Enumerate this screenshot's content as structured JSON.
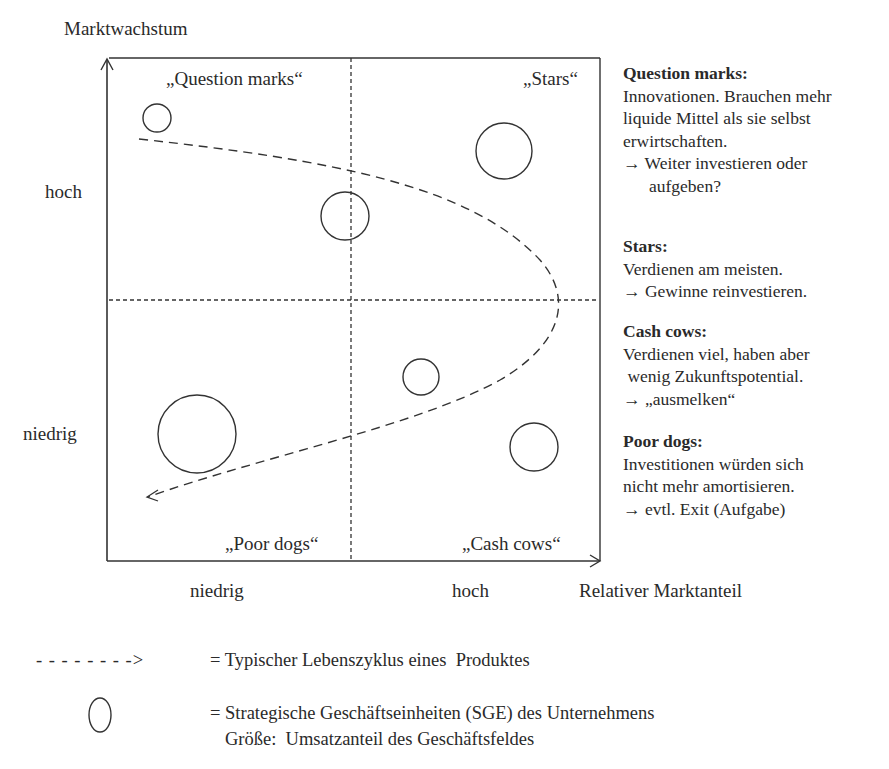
{
  "diagram": {
    "y_axis_title": "Marktwachstum",
    "x_axis_title": "Relativer Marktanteil",
    "y_ticks": [
      "hoch",
      "niedrig"
    ],
    "x_ticks": [
      "niedrig",
      "hoch"
    ],
    "quadrants": {
      "top_left": "„Question marks“",
      "top_right": "„Stars“",
      "bottom_left": "„Poor dogs“",
      "bottom_right": "„Cash cows“"
    },
    "circles": [
      {
        "quadrant": "Question marks",
        "cx": 157,
        "cy": 118,
        "r": 14
      },
      {
        "quadrant": "Question marks/Stars border",
        "cx": 345,
        "cy": 216,
        "r": 24
      },
      {
        "quadrant": "Stars",
        "cx": 504,
        "cy": 151,
        "r": 28
      },
      {
        "quadrant": "Cash cows",
        "cx": 421,
        "cy": 377,
        "r": 18
      },
      {
        "quadrant": "Cash cows",
        "cx": 534,
        "cy": 447,
        "r": 24
      },
      {
        "quadrant": "Poor dogs",
        "cx": 197,
        "cy": 434,
        "r": 39
      }
    ],
    "colors": {
      "line": "#333333",
      "background": "#ffffff"
    }
  },
  "descriptions": [
    {
      "heading": "Question marks:",
      "lines": [
        "Innovationen. Brauchen mehr",
        "liquide Mittel als sie selbst",
        "erwirtschaften."
      ],
      "action": "→ Weiter investieren oder",
      "action_cont": "aufgeben?"
    },
    {
      "heading": "Stars:",
      "lines": [
        "Verdienen am meisten."
      ],
      "action": "→ Gewinne reinvestieren."
    },
    {
      "heading": "Cash cows:",
      "lines": [
        "Verdienen viel, haben aber",
        " wenig Zukunftspotential."
      ],
      "action": "→ „ausmelken“"
    },
    {
      "heading": "Poor dogs:",
      "lines": [
        "Investitionen würden sich",
        "nicht mehr amortisieren."
      ],
      "action": "→ evtl. Exit (Aufgabe)"
    }
  ],
  "legend": {
    "lifecycle_symbol": "- - - - - - - ->",
    "lifecycle_text": "= Typischer Lebenszyklus eines  Produktes",
    "sge_text": "= Strategische Geschäftseinheiten (SGE) des Unternehmens",
    "sge_text2": "Größe:  Umsatzanteil des Geschäftsfeldes"
  }
}
